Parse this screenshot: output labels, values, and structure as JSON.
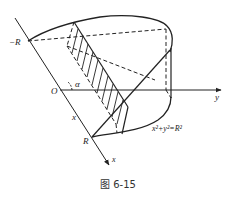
{
  "figure": {
    "caption": "图 6-15",
    "labels": {
      "neg_r": "−R",
      "origin": "O",
      "alpha": "α",
      "r": "R",
      "x_mid": "x",
      "x_axis": "x",
      "y_axis": "y",
      "equation": "x²+y²=R²"
    },
    "colors": {
      "stroke": "#222222",
      "background": "#ffffff"
    }
  }
}
